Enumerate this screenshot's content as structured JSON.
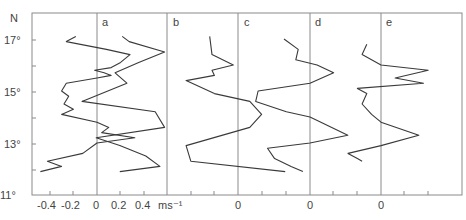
{
  "chart_data": {
    "type": "line",
    "title": "",
    "ylabel": "N",
    "xlabel": "ms⁻¹",
    "y_ticks": [
      "11°",
      "13°",
      "15°",
      "17°"
    ],
    "x_tick_labels_panel_a": [
      "-0.4",
      "-0.2",
      "0",
      "0.2",
      "0.4",
      "ms⁻¹"
    ],
    "ylim": [
      11,
      17.6
    ],
    "panels": [
      "a",
      "b",
      "c",
      "d",
      "e"
    ],
    "panel_zero_labels": [
      "0",
      "0",
      "0",
      "0",
      "0"
    ],
    "grid": false,
    "note": "Five offset velocity profiles (a-e) vs latitude; each panel's zero line marked; tick spacing 0.2 ms-1",
    "series": [
      {
        "name": "a",
        "points": [
          [
            -0.18,
            17.1
          ],
          [
            -0.26,
            16.9
          ],
          [
            0.08,
            16.6
          ],
          [
            0.28,
            16.4
          ],
          [
            0.2,
            16.1
          ],
          [
            0.12,
            15.9
          ],
          [
            -0.02,
            15.8
          ],
          [
            0.06,
            15.7
          ],
          [
            0.12,
            15.6
          ],
          [
            0.0,
            15.5
          ],
          [
            -0.26,
            15.3
          ],
          [
            -0.3,
            15.0
          ],
          [
            -0.24,
            14.8
          ],
          [
            -0.28,
            14.5
          ],
          [
            -0.2,
            14.3
          ],
          [
            -0.3,
            14.1
          ],
          [
            0.0,
            13.8
          ],
          [
            0.1,
            13.6
          ],
          [
            0.04,
            13.4
          ],
          [
            0.32,
            13.2
          ],
          [
            0.0,
            13.0
          ],
          [
            -0.12,
            12.6
          ],
          [
            -0.42,
            12.3
          ],
          [
            -0.3,
            12.1
          ],
          [
            -0.48,
            11.9
          ]
        ]
      },
      {
        "name": "b",
        "points": [
          [
            -0.38,
            17.1
          ],
          [
            -0.32,
            16.9
          ],
          [
            -0.02,
            16.5
          ],
          [
            -0.24,
            16.1
          ],
          [
            -0.44,
            15.7
          ],
          [
            -0.34,
            15.3
          ],
          [
            -0.72,
            14.6
          ],
          [
            -0.1,
            14.2
          ],
          [
            -0.02,
            13.6
          ],
          [
            -0.6,
            13.2
          ],
          [
            -0.4,
            12.9
          ],
          [
            -0.18,
            12.5
          ],
          [
            -0.06,
            12.1
          ],
          [
            -0.4,
            11.9
          ]
        ]
      },
      {
        "name": "c",
        "points": [
          [
            -0.24,
            17.1
          ],
          [
            -0.22,
            16.4
          ],
          [
            -0.04,
            16.0
          ],
          [
            -0.22,
            15.8
          ],
          [
            -0.2,
            15.6
          ],
          [
            -0.44,
            15.4
          ],
          [
            -0.2,
            14.9
          ],
          [
            0.1,
            14.6
          ],
          [
            0.2,
            14.1
          ],
          [
            0.1,
            13.6
          ],
          [
            -0.44,
            12.9
          ],
          [
            -0.4,
            12.3
          ],
          [
            0.4,
            11.9
          ]
        ]
      },
      {
        "name": "d",
        "points": [
          [
            -0.22,
            17.0
          ],
          [
            -0.1,
            16.6
          ],
          [
            -0.12,
            16.2
          ],
          [
            0.06,
            16.0
          ],
          [
            0.2,
            15.7
          ],
          [
            0.0,
            15.3
          ],
          [
            -0.44,
            15.0
          ],
          [
            -0.46,
            14.6
          ],
          [
            -0.2,
            14.2
          ],
          [
            0.0,
            14.0
          ],
          [
            0.32,
            13.3
          ],
          [
            0.0,
            13.0
          ],
          [
            -0.36,
            12.8
          ],
          [
            -0.3,
            12.4
          ],
          [
            -0.16,
            12.1
          ],
          [
            -0.06,
            11.9
          ]
        ]
      },
      {
        "name": "e",
        "points": [
          [
            -0.12,
            16.8
          ],
          [
            -0.16,
            16.4
          ],
          [
            0.0,
            16.0
          ],
          [
            0.4,
            15.8
          ],
          [
            0.12,
            15.5
          ],
          [
            0.36,
            15.3
          ],
          [
            -0.2,
            15.1
          ],
          [
            -0.12,
            14.9
          ],
          [
            -0.16,
            14.5
          ],
          [
            -0.08,
            14.1
          ],
          [
            0.0,
            13.8
          ],
          [
            0.32,
            13.3
          ],
          [
            0.0,
            12.9
          ],
          [
            -0.28,
            12.6
          ],
          [
            -0.2,
            12.4
          ],
          [
            -0.16,
            12.3
          ]
        ]
      }
    ]
  }
}
